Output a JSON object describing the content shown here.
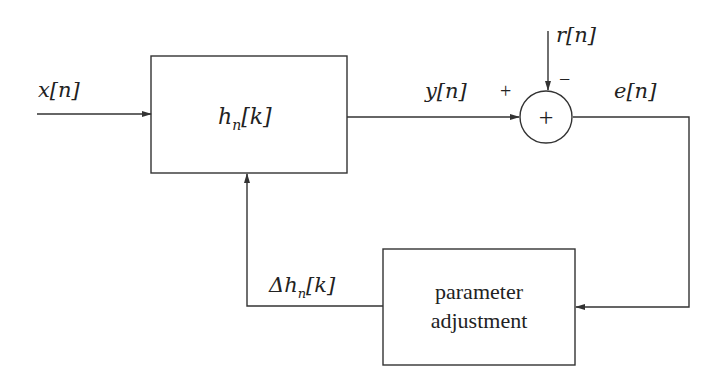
{
  "diagram": {
    "type": "adaptive-filter-block-diagram",
    "blocks": {
      "filter": {
        "label": "h",
        "subscript": "n",
        "arg": "[k]"
      },
      "adjust": {
        "line1": "parameter",
        "line2": "adjustment"
      },
      "summer": {
        "symbol": "+"
      }
    },
    "signals": {
      "input": "x[n]",
      "output": "y[n]",
      "reference": "r[n]",
      "error": "e[n]",
      "update": {
        "prefix": "Δh",
        "subscript": "n",
        "arg": "[k]"
      }
    },
    "signs": {
      "plus": "+",
      "minus": "−"
    }
  }
}
